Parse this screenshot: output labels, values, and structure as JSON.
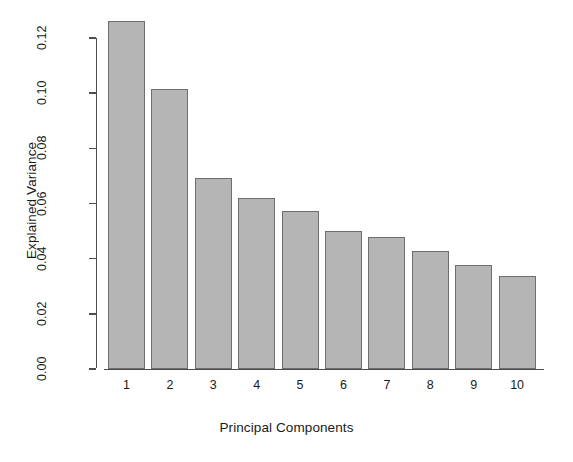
{
  "chart_data": {
    "type": "bar",
    "title": "",
    "subtitle": "",
    "xlabel": "Principal Components",
    "ylabel": "Explained Variance",
    "categories": [
      "1",
      "2",
      "3",
      "4",
      "5",
      "6",
      "7",
      "8",
      "9",
      "10"
    ],
    "values": [
      0.126,
      0.1015,
      0.0694,
      0.062,
      0.0572,
      0.0499,
      0.0477,
      0.0426,
      0.0378,
      0.0338
    ],
    "ylim": [
      0.0,
      0.13
    ],
    "ytick_values": [
      0.0,
      0.02,
      0.04,
      0.06,
      0.08,
      0.1,
      0.12
    ],
    "ytick_labels": [
      "0.00",
      "0.02",
      "0.04",
      "0.06",
      "0.08",
      "0.10",
      "0.12"
    ],
    "grid": false,
    "legend": null,
    "series": [
      {
        "name": "Explained Variance",
        "values": [
          0.126,
          0.1015,
          0.0694,
          0.062,
          0.0572,
          0.0499,
          0.0477,
          0.0426,
          0.0378,
          0.0338
        ]
      }
    ],
    "colors": {
      "bar_fill": "#b5b5b5",
      "bar_border": "#6e6e6e",
      "axis": "#4d4d4d",
      "text": "#1a1a1a",
      "background": "#ffffff"
    }
  }
}
